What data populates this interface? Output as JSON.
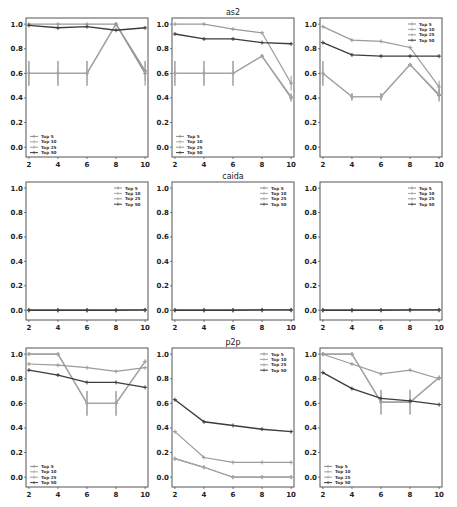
{
  "figure": {
    "x_ticks": [
      2,
      4,
      6,
      8,
      10
    ],
    "y_ticks": [
      0.0,
      0.2,
      0.4,
      0.6,
      0.8,
      1.0
    ],
    "y_tick_labels": [
      "0.0",
      "0.2",
      "0.4",
      "0.6",
      "0.8",
      "1.0"
    ],
    "ylim": [
      -0.08,
      1.05
    ],
    "xlim": [
      1.8,
      10.2
    ],
    "series_colors": {
      "Top 5": "#8a8a8a",
      "Top 10": "#a6a6a6",
      "Top 25": "#9a9a9a",
      "Top 50": "#3c3c3c"
    },
    "layout": {
      "cols_x": [
        [
          26,
          148
        ],
        [
          172,
          294
        ],
        [
          320,
          442
        ]
      ],
      "rows_y": [
        [
          18,
          157
        ],
        [
          182,
          320
        ],
        [
          348,
          487
        ]
      ]
    }
  },
  "chart_data": [
    {
      "type": "line",
      "title": "",
      "row": 0,
      "col": 0,
      "legend_position": "lower left",
      "x": [
        2,
        4,
        6,
        8,
        10
      ],
      "ylim": [
        0,
        1.0
      ],
      "series": [
        {
          "name": "Top 5",
          "values": [
            0.6,
            0.6,
            0.6,
            1.0,
            0.6
          ],
          "errors": [
            0.1,
            0.1,
            0.1,
            0,
            0.1
          ]
        },
        {
          "name": "Top 10",
          "values": [
            0.6,
            0.6,
            0.6,
            1.0,
            0.62
          ],
          "errors": [
            0.1,
            0.1,
            0.1,
            0,
            0.08
          ]
        },
        {
          "name": "Top 25",
          "values": [
            1.0,
            1.0,
            1.0,
            1.0,
            0.62
          ],
          "errors": [
            0,
            0,
            0,
            0,
            0
          ]
        },
        {
          "name": "Top 50",
          "values": [
            0.99,
            0.97,
            0.98,
            0.95,
            0.97
          ],
          "errors": [
            0,
            0,
            0,
            0,
            0
          ]
        }
      ]
    },
    {
      "type": "line",
      "title": "as2",
      "row": 0,
      "col": 1,
      "legend_position": "lower left",
      "x": [
        2,
        4,
        6,
        8,
        10
      ],
      "ylim": [
        0,
        1.0
      ],
      "series": [
        {
          "name": "Top 5",
          "values": [
            0.6,
            0.6,
            0.6,
            0.74,
            0.4
          ],
          "errors": [
            0.1,
            0.1,
            0.1,
            0,
            0.03
          ]
        },
        {
          "name": "Top 10",
          "values": [
            0.6,
            0.6,
            0.6,
            0.74,
            0.41
          ],
          "errors": [
            0.1,
            0.1,
            0.1,
            0,
            0.03
          ]
        },
        {
          "name": "Top 25",
          "values": [
            1.0,
            1.0,
            0.96,
            0.93,
            0.52
          ],
          "errors": [
            0,
            0,
            0,
            0,
            0.06
          ]
        },
        {
          "name": "Top 50",
          "values": [
            0.92,
            0.88,
            0.88,
            0.85,
            0.84
          ],
          "errors": [
            0,
            0,
            0,
            0,
            0
          ]
        }
      ]
    },
    {
      "type": "line",
      "title": "",
      "row": 0,
      "col": 2,
      "legend_position": "upper right",
      "x": [
        2,
        4,
        6,
        8,
        10
      ],
      "ylim": [
        0,
        1.0
      ],
      "series": [
        {
          "name": "Top 5",
          "values": [
            0.6,
            0.41,
            0.41,
            0.67,
            0.42
          ],
          "errors": [
            0.1,
            0.03,
            0.03,
            0,
            0.05
          ]
        },
        {
          "name": "Top 10",
          "values": [
            0.6,
            0.41,
            0.41,
            0.67,
            0.43
          ],
          "errors": [
            0.1,
            0.03,
            0.03,
            0,
            0.05
          ]
        },
        {
          "name": "Top 25",
          "values": [
            0.98,
            0.87,
            0.86,
            0.81,
            0.49
          ],
          "errors": [
            0,
            0,
            0,
            0,
            0.05
          ]
        },
        {
          "name": "Top 50",
          "values": [
            0.85,
            0.75,
            0.74,
            0.74,
            0.74
          ],
          "errors": [
            0,
            0,
            0,
            0,
            0
          ]
        }
      ]
    },
    {
      "type": "line",
      "title": "",
      "row": 1,
      "col": 0,
      "legend_position": "upper right",
      "x": [
        2,
        4,
        6,
        8,
        10
      ],
      "ylim": [
        0,
        1.0
      ],
      "series": [
        {
          "name": "Top 5",
          "values": [
            0.0,
            0.0,
            0.0,
            0.0,
            0.0
          ],
          "errors": [
            0,
            0,
            0,
            0,
            0
          ]
        },
        {
          "name": "Top 10",
          "values": [
            0.0,
            0.0,
            0.0,
            0.0,
            0.0
          ],
          "errors": [
            0,
            0,
            0,
            0,
            0
          ]
        },
        {
          "name": "Top 25",
          "values": [
            0.0,
            0.0,
            0.0,
            0.0,
            0.0
          ],
          "errors": [
            0,
            0,
            0,
            0,
            0
          ]
        },
        {
          "name": "Top 50",
          "values": [
            0.0,
            0.0,
            0.0,
            0.0,
            0.003
          ],
          "errors": [
            0,
            0,
            0,
            0,
            0
          ]
        }
      ]
    },
    {
      "type": "line",
      "title": "caida",
      "row": 1,
      "col": 1,
      "legend_position": "upper right",
      "x": [
        2,
        4,
        6,
        8,
        10
      ],
      "ylim": [
        0,
        1.0
      ],
      "series": [
        {
          "name": "Top 5",
          "values": [
            0.0,
            0.0,
            0.0,
            0.0,
            0.0
          ],
          "errors": [
            0,
            0,
            0,
            0,
            0
          ]
        },
        {
          "name": "Top 10",
          "values": [
            0.0,
            0.0,
            0.0,
            0.0,
            0.0
          ],
          "errors": [
            0,
            0,
            0,
            0,
            0
          ]
        },
        {
          "name": "Top 25",
          "values": [
            0.0,
            0.0,
            0.0,
            0.0,
            0.0
          ],
          "errors": [
            0,
            0,
            0,
            0,
            0
          ]
        },
        {
          "name": "Top 50",
          "values": [
            0.0,
            0.0,
            0.0,
            0.003,
            0.003
          ],
          "errors": [
            0,
            0,
            0,
            0,
            0
          ]
        }
      ]
    },
    {
      "type": "line",
      "title": "",
      "row": 1,
      "col": 2,
      "legend_position": "upper right",
      "x": [
        2,
        4,
        6,
        8,
        10
      ],
      "ylim": [
        0,
        1.0
      ],
      "series": [
        {
          "name": "Top 5",
          "values": [
            0.0,
            0.0,
            0.0,
            0.0,
            0.0
          ],
          "errors": [
            0,
            0,
            0,
            0,
            0
          ]
        },
        {
          "name": "Top 10",
          "values": [
            0.0,
            0.0,
            0.0,
            0.0,
            0.0
          ],
          "errors": [
            0,
            0,
            0,
            0,
            0
          ]
        },
        {
          "name": "Top 25",
          "values": [
            0.0,
            0.0,
            0.0,
            0.0,
            0.0
          ],
          "errors": [
            0,
            0,
            0,
            0,
            0
          ]
        },
        {
          "name": "Top 50",
          "values": [
            0.0,
            0.0,
            0.0,
            0.003,
            0.003
          ],
          "errors": [
            0,
            0,
            0,
            0,
            0
          ]
        }
      ]
    },
    {
      "type": "line",
      "title": "",
      "row": 2,
      "col": 0,
      "legend_position": "lower left",
      "x": [
        2,
        4,
        6,
        8,
        10
      ],
      "ylim": [
        0,
        1.0
      ],
      "series": [
        {
          "name": "Top 5",
          "values": [
            1.0,
            1.0,
            0.6,
            0.6,
            0.94
          ],
          "errors": [
            0,
            0,
            0.1,
            0.1,
            0
          ]
        },
        {
          "name": "Top 10",
          "values": [
            1.0,
            1.0,
            0.6,
            0.6,
            0.94
          ],
          "errors": [
            0,
            0,
            0.1,
            0.1,
            0
          ]
        },
        {
          "name": "Top 25",
          "values": [
            0.92,
            0.91,
            0.89,
            0.86,
            0.89
          ],
          "errors": [
            0,
            0,
            0,
            0,
            0
          ]
        },
        {
          "name": "Top 50",
          "values": [
            0.87,
            0.83,
            0.77,
            0.77,
            0.73
          ],
          "errors": [
            0,
            0,
            0,
            0,
            0
          ]
        }
      ]
    },
    {
      "type": "line",
      "title": "p2p",
      "row": 2,
      "col": 1,
      "legend_position": "upper right",
      "x": [
        2,
        4,
        6,
        8,
        10
      ],
      "ylim": [
        0,
        1.0
      ],
      "series": [
        {
          "name": "Top 5",
          "values": [
            0.15,
            0.08,
            0.0,
            0.0,
            0.0
          ],
          "errors": [
            0,
            0,
            0,
            0,
            0
          ]
        },
        {
          "name": "Top 10",
          "values": [
            0.15,
            0.08,
            0.0,
            0.0,
            0.0
          ],
          "errors": [
            0,
            0,
            0,
            0,
            0
          ]
        },
        {
          "name": "Top 25",
          "values": [
            0.37,
            0.16,
            0.12,
            0.12,
            0.12
          ],
          "errors": [
            0,
            0,
            0,
            0,
            0
          ]
        },
        {
          "name": "Top 50",
          "values": [
            0.63,
            0.45,
            0.42,
            0.39,
            0.37
          ],
          "errors": [
            0,
            0,
            0,
            0,
            0
          ]
        }
      ]
    },
    {
      "type": "line",
      "title": "",
      "row": 2,
      "col": 2,
      "legend_position": "lower left",
      "x": [
        2,
        4,
        6,
        8,
        10
      ],
      "ylim": [
        0,
        1.0
      ],
      "series": [
        {
          "name": "Top 5",
          "values": [
            1.0,
            1.0,
            0.61,
            0.61,
            0.81
          ],
          "errors": [
            0,
            0,
            0.1,
            0.1,
            0
          ]
        },
        {
          "name": "Top 10",
          "values": [
            1.0,
            1.0,
            0.61,
            0.61,
            0.81
          ],
          "errors": [
            0,
            0,
            0.1,
            0.1,
            0
          ]
        },
        {
          "name": "Top 25",
          "values": [
            1.0,
            0.92,
            0.84,
            0.87,
            0.8
          ],
          "errors": [
            0,
            0,
            0,
            0,
            0
          ]
        },
        {
          "name": "Top 50",
          "values": [
            0.85,
            0.72,
            0.64,
            0.62,
            0.59
          ],
          "errors": [
            0,
            0,
            0,
            0,
            0
          ]
        }
      ]
    }
  ]
}
